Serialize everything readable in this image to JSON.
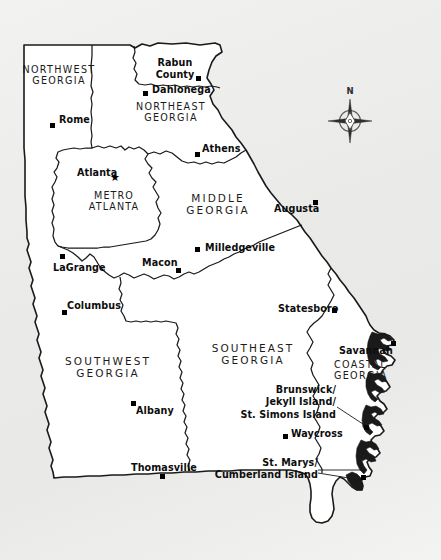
{
  "map": {
    "title": "Georgia Tourism Regions Map",
    "background_color": "#ececeb",
    "land_color": "#ffffff",
    "line_color": "#1a1a1a",
    "regions": [
      {
        "id": "northwest-georgia",
        "name": "NORTHWEST\nGEORGIA",
        "line1": "NORTHWEST",
        "line2": "GEORGIA"
      },
      {
        "id": "northeast-georgia",
        "name": "NORTHEAST\nGEORGIA",
        "line1": "NORTHEAST",
        "line2": "GEORGIA"
      },
      {
        "id": "metro-atlanta",
        "name": "METRO\nATLANTA",
        "line1": "METRO",
        "line2": "ATLANTA"
      },
      {
        "id": "middle-georgia",
        "name": "MIDDLE\nGEORGIA",
        "line1": "MIDDLE",
        "line2": "GEORGIA"
      },
      {
        "id": "southwest-georgia",
        "name": "SOUTHWEST\nGEORGIA",
        "line1": "SOUTHWEST",
        "line2": "GEORGIA"
      },
      {
        "id": "southeast-georgia",
        "name": "SOUTHEAST\nGEORGIA",
        "line1": "SOUTHEAST",
        "line2": "GEORGIA"
      },
      {
        "id": "coastal-georgia",
        "name": "COASTAL\nGEORGIA",
        "line1": "COASTAL",
        "line2": "GEORGIA"
      }
    ],
    "cities": [
      {
        "id": "rabun-county",
        "label": "Rabun\nCounty",
        "line1": "Rabun",
        "line2": "County",
        "marker": true
      },
      {
        "id": "dahlonega",
        "label": "Dahlonega",
        "marker": true
      },
      {
        "id": "rome",
        "label": "Rome",
        "marker": true
      },
      {
        "id": "athens",
        "label": "Athens",
        "marker": true
      },
      {
        "id": "atlanta",
        "label": "Atlanta",
        "marker": "star"
      },
      {
        "id": "augusta",
        "label": "Augusta",
        "marker": true
      },
      {
        "id": "milledgeville",
        "label": "Milledgeville",
        "marker": true
      },
      {
        "id": "macon",
        "label": "Macon",
        "marker": true
      },
      {
        "id": "lagrange",
        "label": "LaGrange",
        "marker": true
      },
      {
        "id": "columbus",
        "label": "Columbus",
        "marker": true
      },
      {
        "id": "statesboro",
        "label": "Statesboro",
        "marker": true
      },
      {
        "id": "savannah",
        "label": "Savannah",
        "marker": true
      },
      {
        "id": "albany",
        "label": "Albany",
        "marker": true
      },
      {
        "id": "brunswick",
        "label": "Brunswick/\nJekyll Island/\nSt. Simons Island",
        "line1": "Brunswick/",
        "line2": "Jekyll Island/",
        "line3": "St. Simons Island",
        "marker": true
      },
      {
        "id": "waycross",
        "label": "Waycross",
        "marker": true
      },
      {
        "id": "thomasville",
        "label": "Thomasville",
        "marker": true
      },
      {
        "id": "st-marys",
        "label": "St. Marys/\nCumberland Island",
        "line1": "St. Marys/",
        "line2": "Cumberland Island",
        "marker": true
      }
    ],
    "compass": {
      "north_label": "N"
    }
  }
}
